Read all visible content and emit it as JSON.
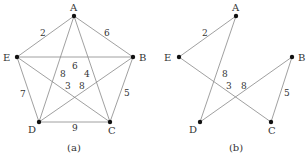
{
  "graphs": [
    {
      "caption": "(a)",
      "vertices": {
        "A": {
          "x": 74,
          "y": 16,
          "lx": 70,
          "ly": 11
        },
        "B": {
          "x": 133,
          "y": 57,
          "lx": 139,
          "ly": 61
        },
        "C": {
          "x": 110,
          "y": 122,
          "lx": 108,
          "ly": 134
        },
        "D": {
          "x": 39,
          "y": 122,
          "lx": 28,
          "ly": 133
        },
        "E": {
          "x": 17,
          "y": 57,
          "lx": 3,
          "ly": 61
        }
      },
      "edges": [
        {
          "from": "A",
          "to": "E",
          "weight": "2",
          "wx": 40,
          "wy": 36
        },
        {
          "from": "A",
          "to": "B",
          "weight": "6",
          "wx": 104,
          "wy": 36
        },
        {
          "from": "E",
          "to": "B",
          "weight": "6",
          "wx": 72,
          "wy": 69
        },
        {
          "from": "E",
          "to": "D",
          "weight": "7",
          "wx": 20,
          "wy": 97
        },
        {
          "from": "B",
          "to": "C",
          "weight": "5",
          "wx": 124,
          "wy": 96
        },
        {
          "from": "D",
          "to": "C",
          "weight": "9",
          "wx": 72,
          "wy": 131
        },
        {
          "from": "A",
          "to": "D",
          "weight": "8",
          "wx": 60,
          "wy": 77
        },
        {
          "from": "A",
          "to": "C",
          "weight": "4",
          "wx": 84,
          "wy": 77
        },
        {
          "from": "E",
          "to": "C",
          "weight": "3",
          "wx": 65,
          "wy": 89
        },
        {
          "from": "D",
          "to": "B",
          "weight": "8",
          "wx": 79,
          "wy": 89
        }
      ],
      "caption_x": 74,
      "caption_y": 151
    },
    {
      "caption": "(b)",
      "vertices": {
        "A": {
          "x": 236,
          "y": 16,
          "lx": 232,
          "ly": 11
        },
        "B": {
          "x": 292,
          "y": 57,
          "lx": 298,
          "ly": 61
        },
        "C": {
          "x": 271,
          "y": 122,
          "lx": 268,
          "ly": 134
        },
        "D": {
          "x": 200,
          "y": 122,
          "lx": 189,
          "ly": 133
        },
        "E": {
          "x": 179,
          "y": 57,
          "lx": 164,
          "ly": 61
        }
      },
      "edges": [
        {
          "from": "A",
          "to": "E",
          "weight": "2",
          "wx": 202,
          "wy": 36
        },
        {
          "from": "A",
          "to": "D",
          "weight": "8",
          "wx": 222,
          "wy": 77
        },
        {
          "from": "E",
          "to": "C",
          "weight": "3",
          "wx": 226,
          "wy": 89
        },
        {
          "from": "D",
          "to": "B",
          "weight": "8",
          "wx": 241,
          "wy": 89
        },
        {
          "from": "B",
          "to": "C",
          "weight": "5",
          "wx": 284,
          "wy": 96
        }
      ],
      "caption_x": 236,
      "caption_y": 151
    }
  ],
  "colors": {
    "edge": "#888888",
    "vertex": "#111111",
    "text": "#333333"
  }
}
